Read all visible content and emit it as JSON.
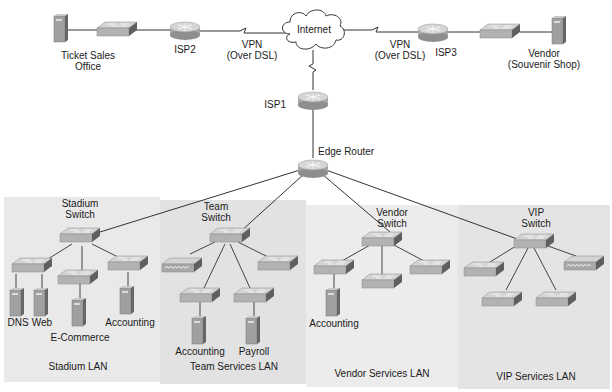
{
  "wan": {
    "ticket_office": {
      "line1": "Ticket Sales",
      "line2": "Office"
    },
    "isp2": "ISP2",
    "vpn_left": {
      "line1": "VPN",
      "line2": "(Over DSL)"
    },
    "internet": "Internet",
    "vpn_right": {
      "line1": "VPN",
      "line2": "(Over DSL)"
    },
    "isp3": "ISP3",
    "vendor_shop": {
      "line1": "Vendor",
      "line2": "(Souvenir Shop)"
    },
    "isp1": "ISP1",
    "edge_router": "Edge Router"
  },
  "lans": [
    {
      "name": "Stadium LAN",
      "switch": {
        "line1": "Stadium",
        "line2": "Switch"
      },
      "servers": [
        "DNS",
        "Web",
        "E-Commerce",
        "Accounting"
      ]
    },
    {
      "name": "Team Services LAN",
      "switch": {
        "line1": "Team",
        "line2": "Switch"
      },
      "servers": [
        "Accounting",
        "Payroll"
      ]
    },
    {
      "name": "Vendor Services LAN",
      "switch": {
        "line1": "Vendor",
        "line2": "Switch"
      },
      "servers": [
        "Accounting"
      ]
    },
    {
      "name": "VIP Services LAN",
      "switch": {
        "line1": "VIP",
        "line2": "Switch"
      },
      "servers": []
    }
  ],
  "colors": {
    "lan_bg_a": "#e6e6e6",
    "lan_bg_b": "#dedede",
    "device": "#b5b5b5",
    "device_dark": "#5e5e5e",
    "line": "#333333"
  }
}
